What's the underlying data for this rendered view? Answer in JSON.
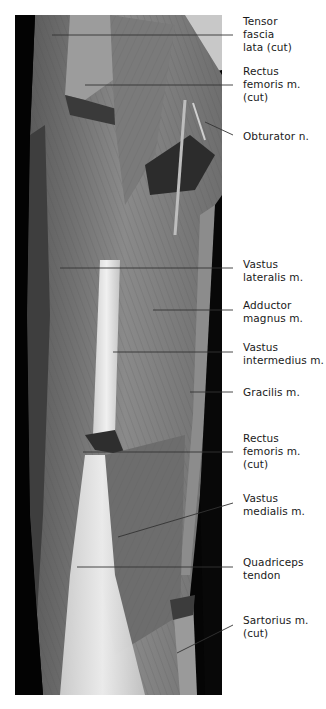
{
  "figure": {
    "type": "annotated anatomical photograph",
    "labels": [
      {
        "id": "tensor-fascia-lata",
        "text": "Tensor\nfascia\nlata (cut)",
        "top": 15
      },
      {
        "id": "rectus-femoris-cut-upper",
        "text": "Rectus\nfemoris m.\n(cut)",
        "top": 65
      },
      {
        "id": "obturator-n",
        "text": "Obturator n.",
        "top": 130
      },
      {
        "id": "vastus-lateralis",
        "text": "Vastus\nlateralis m.",
        "top": 258
      },
      {
        "id": "adductor-magnus",
        "text": "Adductor\nmagnus m.",
        "top": 299
      },
      {
        "id": "vastus-intermedius",
        "text": "Vastus\nintermedius m.",
        "top": 341
      },
      {
        "id": "gracilis",
        "text": "Gracilis m.",
        "top": 386
      },
      {
        "id": "rectus-femoris-cut-lower",
        "text": "Rectus\nfemoris m.\n(cut)",
        "top": 432
      },
      {
        "id": "vastus-medialis",
        "text": "Vastus\nmedialis m.",
        "top": 492
      },
      {
        "id": "quadriceps-tendon",
        "text": "Quadriceps\ntendon",
        "top": 556
      },
      {
        "id": "sartorius-cut",
        "text": "Sartorius m.\n(cut)",
        "top": 614
      }
    ],
    "colors": {
      "background": "#ffffff",
      "label_text": "#1a1a1a",
      "leader_line": "#333333"
    }
  }
}
